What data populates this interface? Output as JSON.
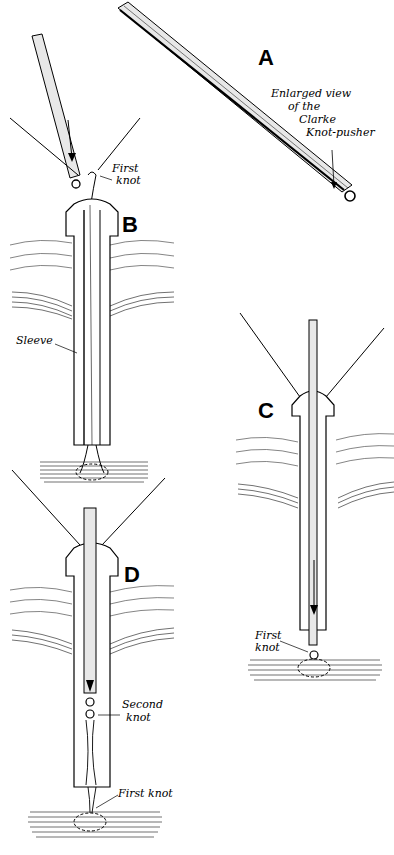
{
  "figure": {
    "panels": [
      {
        "id": "A",
        "letter": "A",
        "annotations": [
          "Enlarged view",
          "of the",
          "Clarke",
          "Knot-pusher"
        ]
      },
      {
        "id": "B",
        "letter": "B",
        "annotations": [
          "First",
          "knot",
          "Sleeve"
        ]
      },
      {
        "id": "C",
        "letter": "C",
        "annotations": [
          "First",
          "knot"
        ]
      },
      {
        "id": "D",
        "letter": "D",
        "annotations": [
          "Second",
          "knot",
          "First knot"
        ]
      }
    ],
    "labels": {
      "a_letter": "A",
      "a_note_1": "Enlarged view",
      "a_note_2": "of the",
      "a_note_3": "Clarke",
      "a_note_4": "Knot-pusher",
      "b_letter": "B",
      "b_first_1": "First",
      "b_first_2": "knot",
      "b_sleeve": "Sleeve",
      "c_letter": "C",
      "c_first_1": "First",
      "c_first_2": "knot",
      "d_letter": "D",
      "d_second_1": "Second",
      "d_second_2": "knot",
      "d_first": "First knot"
    }
  }
}
